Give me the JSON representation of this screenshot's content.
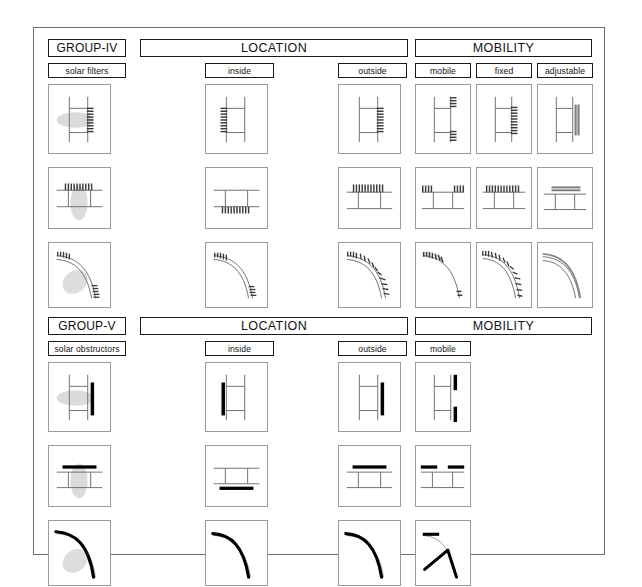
{
  "page": {
    "frame_color": "#6e6e6e",
    "background": "#ffffff"
  },
  "sections": [
    {
      "id": "group-iv",
      "group_label": "GROUP-IV",
      "subject_label": "solar filters",
      "device_style": "hatched",
      "categories": [
        {
          "id": "location",
          "label": "LOCATION",
          "columns": [
            {
              "id": "inside",
              "label": "inside"
            },
            {
              "id": "outside",
              "label": "outside"
            }
          ]
        },
        {
          "id": "mobility",
          "label": "MOBILITY",
          "columns": [
            {
              "id": "mobile",
              "label": "mobile"
            },
            {
              "id": "fixed",
              "label": "fixed"
            },
            {
              "id": "adjustable",
              "label": "adjustable"
            }
          ]
        }
      ],
      "rows": [
        {
          "id": "vertical",
          "name": "vertical-wall-section"
        },
        {
          "id": "horizontal",
          "name": "horizontal-roof-section"
        },
        {
          "id": "curved",
          "name": "curved-dome-section"
        }
      ]
    },
    {
      "id": "group-v",
      "group_label": "GROUP-V",
      "subject_label": "solar obstructors",
      "device_style": "solid",
      "categories": [
        {
          "id": "location",
          "label": "LOCATION",
          "columns": [
            {
              "id": "inside",
              "label": "inside"
            },
            {
              "id": "outside",
              "label": "outside"
            }
          ]
        },
        {
          "id": "mobility",
          "label": "MOBILITY",
          "columns": [
            {
              "id": "mobile",
              "label": "mobile"
            }
          ]
        }
      ],
      "rows": [
        {
          "id": "vertical",
          "name": "vertical-wall-section"
        },
        {
          "id": "horizontal",
          "name": "horizontal-roof-section"
        },
        {
          "id": "curved",
          "name": "curved-dome-section"
        }
      ]
    }
  ],
  "colors": {
    "line": "#6e6e6e",
    "label_border": "#1a1a1a",
    "cell_border": "#9a9a9a",
    "device_solid": "#000000",
    "device_hatch": "#4a4a4a",
    "shadow": "#cccccc"
  }
}
